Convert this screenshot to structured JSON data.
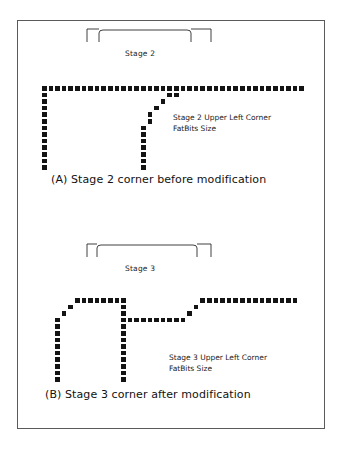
{
  "figure": {
    "title_visible": false,
    "cell_size": 6.6,
    "ink_color": "#141414",
    "frame_color": "#5a5a5a",
    "background": "#ffffff"
  },
  "panels": [
    {
      "id": "panel-a",
      "caption": "(A)  Stage 2 corner before modification",
      "stage_label": "Stage 2",
      "note_line1": "Stage 2 Upper Left Corner",
      "note_line2": "FatBits Size",
      "bracket": {
        "outer_left_x": 86,
        "outer_right_x": 210,
        "inner_left_x": 98,
        "inner_right_x": 190,
        "top_y": 28,
        "tick_height": 13
      },
      "label_pos": {
        "x": 124,
        "y": 48
      },
      "note_pos": {
        "x": 172,
        "y": 112
      },
      "caption_pos": {
        "x": 50,
        "y": 172
      },
      "grid_origin": {
        "x": 40,
        "y": 84
      },
      "cells": [
        [
          0,
          0
        ],
        [
          1,
          0
        ],
        [
          2,
          0
        ],
        [
          3,
          0
        ],
        [
          4,
          0
        ],
        [
          5,
          0
        ],
        [
          6,
          0
        ],
        [
          7,
          0
        ],
        [
          8,
          0
        ],
        [
          9,
          0
        ],
        [
          10,
          0
        ],
        [
          11,
          0
        ],
        [
          12,
          0
        ],
        [
          13,
          0
        ],
        [
          14,
          0
        ],
        [
          15,
          0
        ],
        [
          16,
          0
        ],
        [
          17,
          0
        ],
        [
          18,
          0
        ],
        [
          19,
          0
        ],
        [
          20,
          0
        ],
        [
          21,
          0
        ],
        [
          22,
          0
        ],
        [
          23,
          0
        ],
        [
          24,
          0
        ],
        [
          25,
          0
        ],
        [
          26,
          0
        ],
        [
          27,
          0
        ],
        [
          28,
          0
        ],
        [
          29,
          0
        ],
        [
          30,
          0
        ],
        [
          31,
          0
        ],
        [
          32,
          0
        ],
        [
          33,
          0
        ],
        [
          34,
          0
        ],
        [
          35,
          0
        ],
        [
          36,
          0
        ],
        [
          37,
          0
        ],
        [
          38,
          0
        ],
        [
          39,
          0
        ],
        [
          0,
          1
        ],
        [
          0,
          2
        ],
        [
          0,
          3
        ],
        [
          0,
          4
        ],
        [
          0,
          5
        ],
        [
          0,
          6
        ],
        [
          0,
          7
        ],
        [
          0,
          8
        ],
        [
          0,
          9
        ],
        [
          0,
          10
        ],
        [
          0,
          11
        ],
        [
          0,
          12
        ],
        [
          19,
          1
        ],
        [
          20,
          1
        ],
        [
          18,
          2
        ],
        [
          17,
          3
        ],
        [
          16,
          4
        ],
        [
          16,
          5
        ],
        [
          15,
          6
        ],
        [
          15,
          7
        ],
        [
          15,
          8
        ],
        [
          15,
          9
        ],
        [
          15,
          10
        ],
        [
          15,
          11
        ],
        [
          15,
          12
        ]
      ]
    },
    {
      "id": "panel-b",
      "caption": "(B)  Stage 3 corner after modification",
      "stage_label": "Stage 3",
      "note_line1": "Stage 3 Upper Left Corner",
      "note_line2": "FatBits Size",
      "bracket": {
        "outer_left_x": 86,
        "outer_right_x": 210,
        "inner_left_x": 96,
        "inner_right_x": 196,
        "top_y": 243,
        "tick_height": 13
      },
      "label_pos": {
        "x": 124,
        "y": 263
      },
      "note_pos": {
        "x": 168,
        "y": 352
      },
      "caption_pos": {
        "x": 44,
        "y": 387
      },
      "grid_origin": {
        "x": 40,
        "y": 296
      },
      "cells": [
        [
          5,
          0
        ],
        [
          6,
          0
        ],
        [
          7,
          0
        ],
        [
          8,
          0
        ],
        [
          9,
          0
        ],
        [
          10,
          0
        ],
        [
          11,
          0
        ],
        [
          12,
          0
        ],
        [
          24,
          0
        ],
        [
          25,
          0
        ],
        [
          26,
          0
        ],
        [
          27,
          0
        ],
        [
          28,
          0
        ],
        [
          29,
          0
        ],
        [
          30,
          0
        ],
        [
          31,
          0
        ],
        [
          32,
          0
        ],
        [
          33,
          0
        ],
        [
          34,
          0
        ],
        [
          35,
          0
        ],
        [
          36,
          0
        ],
        [
          37,
          0
        ],
        [
          38,
          0
        ],
        [
          4,
          1
        ],
        [
          12,
          1
        ],
        [
          23,
          1
        ],
        [
          3,
          2
        ],
        [
          12,
          2
        ],
        [
          22,
          2
        ],
        [
          2,
          3
        ],
        [
          12,
          3
        ],
        [
          13,
          3
        ],
        [
          14,
          3
        ],
        [
          15,
          3
        ],
        [
          16,
          3
        ],
        [
          17,
          3
        ],
        [
          18,
          3
        ],
        [
          19,
          3
        ],
        [
          20,
          3
        ],
        [
          21,
          3
        ],
        [
          2,
          4
        ],
        [
          12,
          4
        ],
        [
          2,
          5
        ],
        [
          12,
          5
        ],
        [
          2,
          6
        ],
        [
          12,
          6
        ],
        [
          2,
          7
        ],
        [
          12,
          7
        ],
        [
          2,
          8
        ],
        [
          12,
          8
        ],
        [
          2,
          9
        ],
        [
          12,
          9
        ],
        [
          2,
          10
        ],
        [
          12,
          10
        ],
        [
          2,
          11
        ],
        [
          12,
          11
        ],
        [
          2,
          12
        ],
        [
          12,
          12
        ]
      ]
    }
  ]
}
